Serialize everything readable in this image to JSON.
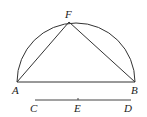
{
  "diagram": {
    "type": "geometry",
    "stroke_color": "#333333",
    "points": {
      "A": {
        "label": "A",
        "x": 17,
        "y": 82
      },
      "B": {
        "label": "B",
        "x": 135,
        "y": 82
      },
      "F": {
        "label": "F",
        "x": 69,
        "y": 22
      },
      "C": {
        "label": "C",
        "x": 35,
        "y": 100
      },
      "D": {
        "label": "D",
        "x": 131,
        "y": 100
      },
      "E": {
        "label": "E",
        "x": 78,
        "y": 100
      }
    },
    "labels": {
      "A": "A",
      "B": "B",
      "F": "F",
      "C": "C",
      "D": "D",
      "E": "E"
    },
    "segments": [
      {
        "from": "A",
        "to": "B"
      },
      {
        "from": "A",
        "to": "F"
      },
      {
        "from": "F",
        "to": "B"
      },
      {
        "from": "C",
        "to": "D"
      }
    ],
    "arcs": [
      {
        "type": "semicircle",
        "diameter": [
          "A",
          "B"
        ],
        "side": "above"
      }
    ],
    "ticks": [
      {
        "at": "E",
        "on": "CD"
      }
    ]
  }
}
